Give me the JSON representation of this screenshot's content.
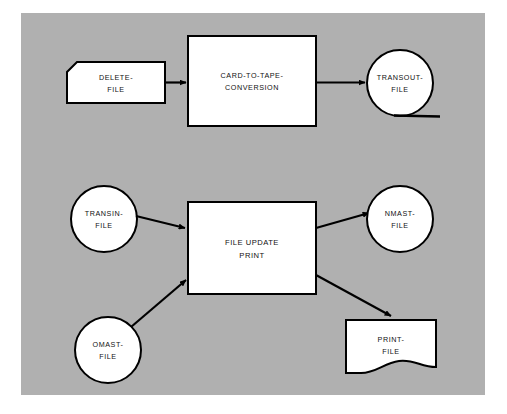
{
  "canvas": {
    "width": 507,
    "height": 414,
    "page_background": "#ffffff",
    "panel_background": "#b0b0b0",
    "ink_color": "#000000",
    "shape_fill": "#ffffff"
  },
  "diagram": {
    "type": "system-flowchart",
    "title": "",
    "flows": [
      {
        "name": "card-to-tape-flow",
        "inputs": [
          "delete-file"
        ],
        "process": "card-to-tape-conversion",
        "outputs": [
          "transout-file"
        ]
      },
      {
        "name": "file-update-flow",
        "inputs": [
          "transin-file",
          "omast-file"
        ],
        "process": "file-update-print",
        "outputs": [
          "nmast-file",
          "print-file"
        ]
      }
    ],
    "nodes": [
      {
        "id": "delete-file",
        "symbol": "punched-card",
        "label_lines": [
          "DELETE-",
          "FILE"
        ],
        "x": 67,
        "y": 62,
        "w": 98,
        "h": 41,
        "cut": 10
      },
      {
        "id": "card-to-tape-conversion",
        "symbol": "process",
        "label_lines": [
          "CARD-TO-TAPE-",
          "CONVERSION"
        ],
        "x": 188,
        "y": 36,
        "w": 128,
        "h": 90
      },
      {
        "id": "transout-file",
        "symbol": "magnetic-tape",
        "label_lines": [
          "TRANSOUT-",
          "FILE"
        ],
        "cx": 400,
        "cy": 83,
        "r": 33
      },
      {
        "id": "transin-file",
        "symbol": "magnetic-tape-plain",
        "label_lines": [
          "TRANSIN-",
          "FILE"
        ],
        "cx": 104,
        "cy": 219,
        "r": 33
      },
      {
        "id": "file-update-print",
        "symbol": "process",
        "label_lines": [
          "FILE UPDATE",
          "PRINT"
        ],
        "x": 188,
        "y": 202,
        "w": 128,
        "h": 92
      },
      {
        "id": "nmast-file",
        "symbol": "magnetic-tape-plain",
        "label_lines": [
          "NMAST-",
          "FILE"
        ],
        "cx": 400,
        "cy": 219,
        "r": 33
      },
      {
        "id": "omast-file",
        "symbol": "magnetic-tape-plain",
        "label_lines": [
          "OMAST-",
          "FILE"
        ],
        "cx": 108,
        "cy": 350,
        "r": 33
      },
      {
        "id": "print-file",
        "symbol": "document",
        "label_lines": [
          "PRINT-",
          "FILE"
        ],
        "x": 346,
        "y": 320,
        "w": 90,
        "h": 55
      }
    ],
    "connectors": [
      {
        "id": "delete-to-conversion",
        "from": "delete-file",
        "to": "card-to-tape-conversion",
        "arrow": true
      },
      {
        "id": "conversion-to-transout",
        "from": "card-to-tape-conversion",
        "to": "transout-file",
        "arrow": true
      },
      {
        "id": "transin-to-update",
        "from": "transin-file",
        "to": "file-update-print",
        "arrow": true
      },
      {
        "id": "omast-to-update",
        "from": "omast-file",
        "to": "file-update-print",
        "arrow": true
      },
      {
        "id": "update-to-nmast",
        "from": "file-update-print",
        "to": "nmast-file",
        "arrow": true
      },
      {
        "id": "update-to-print",
        "from": "file-update-print",
        "to": "print-file",
        "arrow": true
      }
    ]
  },
  "labels": {
    "delete_file_l1": "DELETE-",
    "delete_file_l2": "FILE",
    "conversion_l1": "CARD-TO-TAPE-",
    "conversion_l2": "CONVERSION",
    "transout_l1": "TRANSOUT-",
    "transout_l2": "FILE",
    "transin_l1": "TRANSIN-",
    "transin_l2": "FILE",
    "update_l1": "FILE UPDATE",
    "update_l2": "PRINT",
    "nmast_l1": "NMAST-",
    "nmast_l2": "FILE",
    "omast_l1": "OMAST-",
    "omast_l2": "FILE",
    "print_l1": "PRINT-",
    "print_l2": "FILE"
  }
}
